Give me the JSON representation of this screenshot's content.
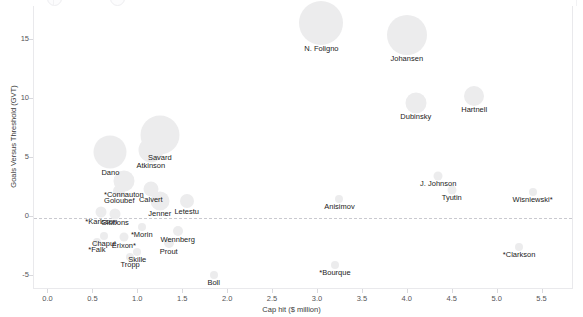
{
  "chart_data": {
    "type": "scatter",
    "title": "",
    "xlabel": "Cap hit ($ million)",
    "ylabel": "Goals Versus Threshold (GVT)",
    "xlim": [
      -0.15,
      5.85
    ],
    "ylim": [
      -6.2,
      17.8
    ],
    "xticks": [
      "0.0",
      "0.5",
      "1.0",
      "1.5",
      "2.0",
      "2.5",
      "3.0",
      "3.5",
      "4.0",
      "4.5",
      "5.0",
      "5.5"
    ],
    "xtick_values": [
      0.0,
      0.5,
      1.0,
      1.5,
      2.0,
      2.5,
      3.0,
      3.5,
      4.0,
      4.5,
      5.0,
      5.5
    ],
    "yticks": [
      "15",
      "10",
      "5",
      "0",
      "-5"
    ],
    "ytick_values": [
      15,
      10,
      5,
      0,
      -5
    ],
    "grid": false,
    "legend": "none",
    "reference_line": {
      "axis": "y",
      "value": 0,
      "style": "dashed"
    },
    "bubble_color": "#ececed",
    "size_encoding": "bubble area scales with player ice time / value",
    "points": [
      {
        "label": "N. Foligno",
        "x": 3.05,
        "y": 16.4,
        "size": 44
      },
      {
        "label": "Johansen",
        "x": 4.0,
        "y": 15.3,
        "size": 40
      },
      {
        "label": "Hartnell",
        "x": 4.75,
        "y": 10.2,
        "size": 20
      },
      {
        "label": "Dubinsky",
        "x": 4.1,
        "y": 9.6,
        "size": 21
      },
      {
        "label": "Savard",
        "x": 1.25,
        "y": 6.9,
        "size": 39
      },
      {
        "label": "Atkinson",
        "x": 1.15,
        "y": 5.6,
        "size": 25
      },
      {
        "label": "Dano",
        "x": 0.7,
        "y": 5.4,
        "size": 33
      },
      {
        "label": "J. Johnson",
        "x": 4.35,
        "y": 3.4,
        "size": 9
      },
      {
        "label": "*Connauton",
        "x": 0.85,
        "y": 3.0,
        "size": 21
      },
      {
        "label": "Tyutin",
        "x": 4.5,
        "y": 2.2,
        "size": 9
      },
      {
        "label": "Calvert",
        "x": 1.15,
        "y": 2.3,
        "size": 15
      },
      {
        "label": "Goloubef",
        "x": 0.8,
        "y": 2.1,
        "size": 12
      },
      {
        "label": "Wisniewski*",
        "x": 5.4,
        "y": 2.0,
        "size": 8
      },
      {
        "label": "Jenner",
        "x": 1.25,
        "y": 1.3,
        "size": 19
      },
      {
        "label": "Letestu",
        "x": 1.55,
        "y": 1.3,
        "size": 14
      },
      {
        "label": "Anisimov",
        "x": 3.25,
        "y": 1.4,
        "size": 8
      },
      {
        "label": "*Karlsson",
        "x": 0.6,
        "y": 0.3,
        "size": 11
      },
      {
        "label": "Gibbons",
        "x": 0.75,
        "y": 0.2,
        "size": 11
      },
      {
        "label": "*Morin",
        "x": 1.05,
        "y": -0.9,
        "size": 8
      },
      {
        "label": "Wennberg",
        "x": 1.45,
        "y": -1.3,
        "size": 10
      },
      {
        "label": "Chaput",
        "x": 0.63,
        "y": -1.7,
        "size": 8
      },
      {
        "label": "Erixon*",
        "x": 0.85,
        "y": -1.8,
        "size": 9
      },
      {
        "label": "*Falk",
        "x": 0.55,
        "y": -2.2,
        "size": 8
      },
      {
        "label": "Prout",
        "x": 1.35,
        "y": -2.3,
        "size": 10
      },
      {
        "label": "*Clarkson",
        "x": 5.25,
        "y": -2.6,
        "size": 8
      },
      {
        "label": "Skille",
        "x": 1.0,
        "y": -3.1,
        "size": 8
      },
      {
        "label": "Tropp",
        "x": 0.92,
        "y": -3.5,
        "size": 8
      },
      {
        "label": "*Bourque",
        "x": 3.2,
        "y": -4.2,
        "size": 8
      },
      {
        "label": "Boll",
        "x": 1.85,
        "y": -5.0,
        "size": 8
      }
    ]
  }
}
